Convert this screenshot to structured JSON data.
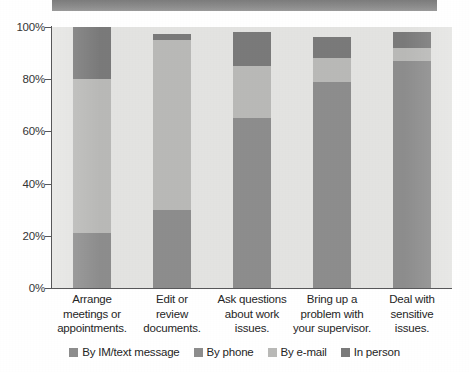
{
  "figure": {
    "title_band_present": true,
    "background_color": "#e3e3e1"
  },
  "legend": {
    "position": "bottom-center",
    "items": [
      {
        "label": "By IM/text message",
        "color": "#8d8d8d",
        "key": "im_text"
      },
      {
        "label": "By phone",
        "color": "#8d8d8d",
        "key": "by_phone"
      },
      {
        "label": "By e-mail",
        "color": "#b9b9b7",
        "key": "by_email"
      },
      {
        "label": "In person",
        "color": "#7a7a7a",
        "key": "in_person"
      }
    ]
  },
  "axis": {
    "y_ticks": [
      "0%",
      "20%",
      "40%",
      "60%",
      "80%",
      "100%"
    ],
    "y_tick_values": [
      0,
      20,
      40,
      60,
      80,
      100
    ]
  },
  "chart_data": {
    "type": "bar",
    "title": "",
    "subtitle": "",
    "xlabel": "",
    "ylabel": "",
    "ylim": [
      0,
      100
    ],
    "grid": false,
    "stacked": true,
    "legend_position": "bottom",
    "categories": [
      "Arrange meetings or appointments.",
      "Edit or review documents.",
      "Ask questions about work issues.",
      "Bring up a problem with your supervisor.",
      "Deal with sensitive issues."
    ],
    "series": [
      {
        "name": "By IM/text message",
        "color": "#8d8d8d",
        "values": [
          21,
          30,
          65,
          79,
          87
        ]
      },
      {
        "name": "By phone",
        "color": "#8d8d8d",
        "values": [
          0,
          0,
          0,
          0,
          0
        ]
      },
      {
        "name": "By e-mail",
        "color": "#b9b9b7",
        "values": [
          59,
          65,
          20,
          9,
          5
        ]
      },
      {
        "name": "In person",
        "color": "#7a7a7a",
        "values": [
          20,
          2.5,
          13,
          8,
          6
        ]
      }
    ],
    "bar_tops": [
      100,
      97.5,
      98,
      96,
      98
    ]
  },
  "categories_display": [
    {
      "line1": "Arrange",
      "line2": "meetings or",
      "line3": "appointments."
    },
    {
      "line1": "Edit or",
      "line2": "review",
      "line3": "documents."
    },
    {
      "line1": "Ask questions",
      "line2": "about work",
      "line3": "issues."
    },
    {
      "line1": "Bring up a",
      "line2": "problem with",
      "line3": "your supervisor."
    },
    {
      "line1": "Deal with",
      "line2": "sensitive",
      "line3": "issues."
    }
  ]
}
